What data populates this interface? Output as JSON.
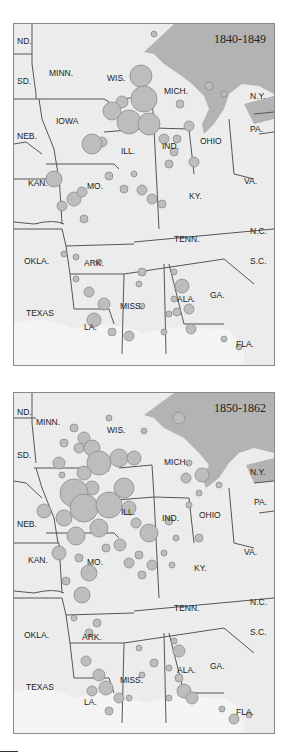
{
  "maps": [
    {
      "period": "1840-1849",
      "labels": {
        "nd": "ND.",
        "sd": "SD.",
        "minn": "MINN.",
        "wis": "WIS.",
        "iowa": "IOWA",
        "neb": "NEB.",
        "kan": "KAN.",
        "mo": "MO.",
        "ill": "ILL.",
        "ind": "IND.",
        "mich": "MICH.",
        "ohio": "OHIO",
        "ny": "N.Y.",
        "pa": "PA.",
        "va": "VA.",
        "ky": "KY.",
        "tenn": "TENN.",
        "nc": "N.C.",
        "sc": "S.C.",
        "okla": "OKLA.",
        "ark": "ARK.",
        "miss": "MISS.",
        "ala": "ALA.",
        "ga": "GA.",
        "texas": "TEXAS",
        "la": "LA.",
        "fla": "FLA."
      }
    },
    {
      "period": "1850-1862",
      "labels": {
        "nd": "ND.",
        "sd": "SD.",
        "minn": "MINN.",
        "wis": "WIS.",
        "iowa": "",
        "neb": "NEB.",
        "kan": "KAN.",
        "mo": "MO.",
        "ill": "ILL.",
        "ind": "IND.",
        "mich": "MICH.",
        "ohio": "OHIO",
        "ny": "N.Y.",
        "pa": "PA.",
        "va": "VA.",
        "ky": "KY.",
        "tenn": "TENN.",
        "nc": "N.C.",
        "sc": "S.C.",
        "okla": "OKLA.",
        "ark": "ARK.",
        "miss": "MISS.",
        "ala": "ALA.",
        "ga": "GA.",
        "texas": "TEXAS",
        "la": "LA.",
        "fla": "FLA."
      }
    }
  ],
  "colors": {
    "land": "#ececec",
    "water": "#b3b3b3",
    "border": "#555555",
    "circle_fill": "#bdbdbd",
    "circle_stroke": "#8c8c8c"
  }
}
